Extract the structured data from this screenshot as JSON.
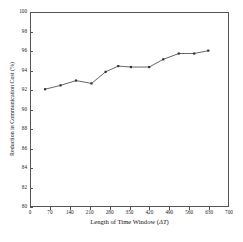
{
  "chart_data": {
    "type": "line",
    "title": "",
    "xlabel": "Length of Time Window (ΔT)",
    "ylabel": "Reduction in Communication Cost (%)",
    "xlim": [
      0,
      700
    ],
    "ylim": [
      80,
      100
    ],
    "grid": false,
    "legend": "none",
    "marker": "square",
    "line_color": "#555555",
    "marker_color": "#333333",
    "x_ticks": [
      0,
      70,
      140,
      210,
      280,
      350,
      420,
      490,
      560,
      630,
      700
    ],
    "y_ticks": [
      80,
      82,
      84,
      86,
      88,
      90,
      92,
      94,
      96,
      98,
      100
    ],
    "series": [
      {
        "name": "Reduction in Communication Cost",
        "x": [
          50,
          105,
          160,
          215,
          265,
          310,
          355,
          420,
          470,
          525,
          580,
          630
        ],
        "values": [
          92.1,
          92.5,
          93.0,
          92.7,
          93.9,
          94.5,
          94.4,
          94.4,
          95.2,
          95.8,
          95.8,
          96.1
        ]
      }
    ]
  },
  "axes": {
    "y_tick_labels": [
      "100",
      "98",
      "96",
      "94",
      "92",
      "90",
      "88",
      "86",
      "84",
      "82",
      "80"
    ],
    "x_tick_labels": [
      "0",
      "70",
      "140",
      "210",
      "280",
      "350",
      "420",
      "490",
      "560",
      "630",
      "700"
    ],
    "x_title_prefix": "Length of Time Window (",
    "x_title_symbol": "ΔT",
    "x_title_suffix": ")",
    "y_title": "Reduction in Communication Cost (%)"
  },
  "caption": {
    "cut_off_text": ""
  }
}
